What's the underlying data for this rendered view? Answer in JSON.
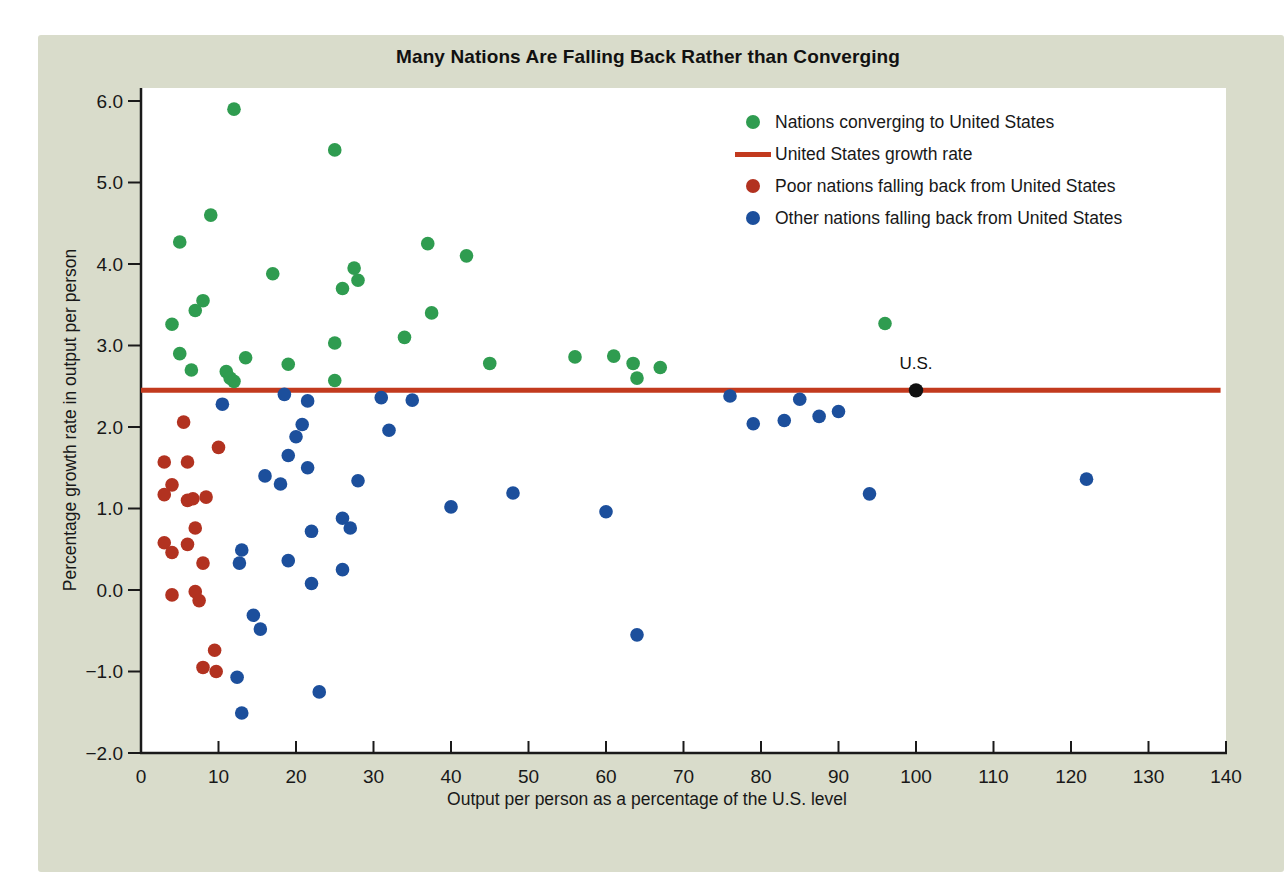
{
  "figure": {
    "panel_bg": "#d9dccb",
    "plot_bg": "#ffffff",
    "axis_color": "#1a1a1a",
    "text_color": "#181818"
  },
  "chart_data": {
    "type": "scatter",
    "title": "Many Nations Are Falling Back Rather than Converging",
    "xlabel": "Output per person as a percentage of the U.S. level",
    "ylabel": "Percentage growth rate in output per person",
    "xlim": [
      0,
      140
    ],
    "ylim": [
      -2.0,
      6.0
    ],
    "grid": false,
    "legend_position": "top-right-inside",
    "x_tick_values": [
      0,
      10,
      20,
      30,
      40,
      50,
      60,
      70,
      80,
      90,
      100,
      110,
      120,
      130,
      140
    ],
    "x_tick_labels": [
      "0",
      "10",
      "20",
      "30",
      "40",
      "50",
      "60",
      "70",
      "80",
      "90",
      "100",
      "110",
      "120",
      "130",
      "140"
    ],
    "y_tick_values": [
      6,
      5,
      4,
      3,
      2,
      1,
      0,
      -1,
      -2
    ],
    "y_tick_labels": [
      "6.0",
      "5.0",
      "4.0",
      "3.0",
      "2.0",
      "1.0",
      "0.0",
      "−1.0",
      "−2.0"
    ],
    "us_line": {
      "label": "United States growth rate",
      "y": 2.45,
      "color": "#c23a1e"
    },
    "us_point": {
      "label": "U.S.",
      "x": 100,
      "y": 2.45,
      "color": "#111111"
    },
    "series": [
      {
        "name": "Nations converging to United States",
        "color": "#2f9c50",
        "points": [
          [
            12,
            5.9
          ],
          [
            25,
            5.4
          ],
          [
            9,
            4.6
          ],
          [
            5,
            4.27
          ],
          [
            37,
            4.25
          ],
          [
            42,
            4.1
          ],
          [
            27.5,
            3.95
          ],
          [
            17,
            3.88
          ],
          [
            28,
            3.8
          ],
          [
            26,
            3.7
          ],
          [
            8,
            3.55
          ],
          [
            7,
            3.43
          ],
          [
            37.5,
            3.4
          ],
          [
            4,
            3.26
          ],
          [
            34,
            3.1
          ],
          [
            25,
            3.03
          ],
          [
            5,
            2.9
          ],
          [
            61,
            2.87
          ],
          [
            56,
            2.86
          ],
          [
            13.5,
            2.85
          ],
          [
            45,
            2.78
          ],
          [
            63.5,
            2.78
          ],
          [
            19,
            2.77
          ],
          [
            67,
            2.73
          ],
          [
            6.5,
            2.7
          ],
          [
            11,
            2.68
          ],
          [
            64,
            2.6
          ],
          [
            11.5,
            2.6
          ],
          [
            25,
            2.57
          ],
          [
            12,
            2.56
          ],
          [
            96,
            3.27
          ]
        ]
      },
      {
        "name": "Poor nations falling back from United States",
        "color": "#b23220",
        "points": [
          [
            5.5,
            2.06
          ],
          [
            10,
            1.75
          ],
          [
            3,
            1.57
          ],
          [
            6,
            1.57
          ],
          [
            4,
            1.29
          ],
          [
            3,
            1.17
          ],
          [
            6,
            1.1
          ],
          [
            6.7,
            1.12
          ],
          [
            8.4,
            1.14
          ],
          [
            7,
            0.76
          ],
          [
            3,
            0.58
          ],
          [
            6,
            0.56
          ],
          [
            4,
            0.46
          ],
          [
            8,
            0.33
          ],
          [
            4,
            -0.06
          ],
          [
            7,
            -0.02
          ],
          [
            7.5,
            -0.13
          ],
          [
            9.5,
            -0.74
          ],
          [
            8,
            -0.95
          ],
          [
            9.7,
            -1.0
          ]
        ]
      },
      {
        "name": "Other nations falling back from United States",
        "color": "#1c4f9c",
        "points": [
          [
            10.5,
            2.28
          ],
          [
            18.5,
            2.4
          ],
          [
            21.5,
            2.32
          ],
          [
            31,
            2.36
          ],
          [
            35,
            2.33
          ],
          [
            76,
            2.38
          ],
          [
            85,
            2.34
          ],
          [
            90,
            2.19
          ],
          [
            87.5,
            2.13
          ],
          [
            83,
            2.08
          ],
          [
            79,
            2.04
          ],
          [
            20.8,
            2.03
          ],
          [
            32,
            1.96
          ],
          [
            20,
            1.88
          ],
          [
            19,
            1.65
          ],
          [
            21.5,
            1.5
          ],
          [
            16,
            1.4
          ],
          [
            18,
            1.3
          ],
          [
            28,
            1.34
          ],
          [
            122,
            1.36
          ],
          [
            94,
            1.18
          ],
          [
            48,
            1.19
          ],
          [
            40,
            1.02
          ],
          [
            60,
            0.96
          ],
          [
            26,
            0.88
          ],
          [
            27,
            0.76
          ],
          [
            22,
            0.72
          ],
          [
            13,
            0.49
          ],
          [
            19,
            0.36
          ],
          [
            12.7,
            0.33
          ],
          [
            26,
            0.25
          ],
          [
            22,
            0.08
          ],
          [
            14.5,
            -0.31
          ],
          [
            15.4,
            -0.48
          ],
          [
            64,
            -0.55
          ],
          [
            12.4,
            -1.07
          ],
          [
            23,
            -1.25
          ],
          [
            13,
            -1.51
          ]
        ]
      }
    ]
  },
  "legend": {
    "items": [
      {
        "marker": "dot",
        "color": "#2f9c50"
      },
      {
        "marker": "line",
        "color": "#c23a1e"
      },
      {
        "marker": "dot",
        "color": "#b23220"
      },
      {
        "marker": "dot",
        "color": "#1c4f9c"
      }
    ]
  }
}
